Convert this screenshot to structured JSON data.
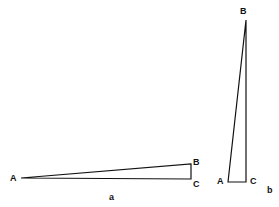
{
  "figure": {
    "panels": [
      {
        "id": "a",
        "caption": "a",
        "vertices": {
          "A": {
            "label": "A",
            "x": 21,
            "y": 178
          },
          "B": {
            "label": "B",
            "x": 191,
            "y": 164
          },
          "C": {
            "label": "C",
            "x": 191,
            "y": 179
          }
        },
        "description": "Long, thin right triangle lying horizontally; right angle at C"
      },
      {
        "id": "b",
        "caption": "b",
        "vertices": {
          "A": {
            "label": "A",
            "x": 228,
            "y": 182
          },
          "B": {
            "label": "B",
            "x": 246,
            "y": 20
          },
          "C": {
            "label": "C",
            "x": 246,
            "y": 182
          }
        },
        "description": "Tall, thin right triangle standing vertically; right angle at C"
      }
    ],
    "colors": {
      "stroke": "#111111",
      "background": "#ffffff"
    }
  }
}
